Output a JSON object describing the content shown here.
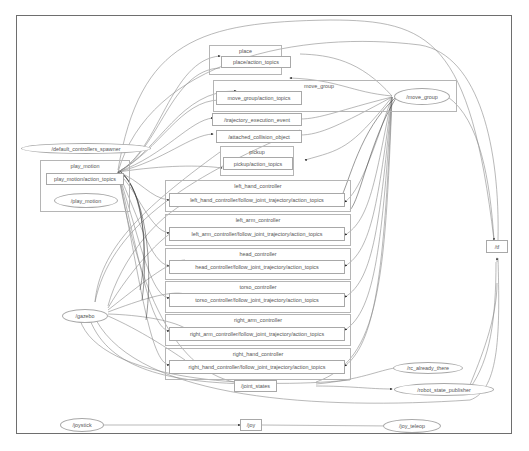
{
  "graph": {
    "clusters": [
      {
        "id": "place",
        "label": "place"
      },
      {
        "id": "move_group",
        "label": "move_group"
      },
      {
        "id": "pickup",
        "label": "pickup"
      },
      {
        "id": "play_motion",
        "label": "play_motion"
      },
      {
        "id": "left_hand_controller",
        "label": "left_hand_controller"
      },
      {
        "id": "left_arm_controller",
        "label": "left_arm_controller"
      },
      {
        "id": "head_controller",
        "label": "head_controller"
      },
      {
        "id": "torso_controller",
        "label": "torso_controller"
      },
      {
        "id": "right_arm_controller",
        "label": "right_arm_controller"
      },
      {
        "id": "right_hand_controller",
        "label": "right_hand_controller"
      }
    ],
    "topics": [
      {
        "id": "place_action_topics",
        "label": "place/action_topics"
      },
      {
        "id": "move_group_action_topics",
        "label": "move_group/action_topics"
      },
      {
        "id": "trajectory_execution_event",
        "label": "/trajectory_execution_event"
      },
      {
        "id": "attached_collision_object",
        "label": "/attached_collision_object"
      },
      {
        "id": "pickup_action_topics",
        "label": "pickup/action_topics"
      },
      {
        "id": "play_motion_action_topics",
        "label": "play_motion/action_topics"
      },
      {
        "id": "left_hand_topics",
        "label": "left_hand_controller/follow_joint_trajectory/action_topics"
      },
      {
        "id": "left_arm_topics",
        "label": "left_arm_controller/follow_joint_trajectory/action_topics"
      },
      {
        "id": "head_topics",
        "label": "head_controller/follow_joint_trajectory/action_topics"
      },
      {
        "id": "torso_topics",
        "label": "torso_controller/follow_joint_trajectory/action_topics"
      },
      {
        "id": "right_arm_topics",
        "label": "right_arm_controller/follow_joint_trajectory/action_topics"
      },
      {
        "id": "right_hand_topics",
        "label": "right_hand_controller/follow_joint_trajectory/action_topics"
      },
      {
        "id": "joint_states",
        "label": "/joint_states"
      },
      {
        "id": "tf",
        "label": "/tf"
      },
      {
        "id": "joy",
        "label": "/joy"
      }
    ],
    "nodes": [
      {
        "id": "move_group_node",
        "label": "/move_group"
      },
      {
        "id": "default_controllers_spawner",
        "label": "/default_controllers_spawner"
      },
      {
        "id": "play_motion_node",
        "label": "/play_motion"
      },
      {
        "id": "gazebo",
        "label": "/gazebo"
      },
      {
        "id": "rc_already_there",
        "label": "/rc_already_there"
      },
      {
        "id": "robot_state_publisher",
        "label": "/robot_state_publisher"
      },
      {
        "id": "joystick",
        "label": "/joystick"
      },
      {
        "id": "joy_teleop",
        "label": "/joy_teleop"
      }
    ]
  }
}
